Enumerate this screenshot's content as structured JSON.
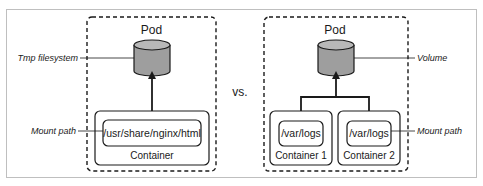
{
  "diagram": {
    "title": "",
    "separator_label": "vs.",
    "colors": {
      "frame": "#bfbfbf",
      "stroke": "#1a1a1a",
      "volume_fill": "#9e9e9e",
      "volume_top": "#b8b8b8",
      "container_fill": "#ffffff"
    },
    "left": {
      "pod_label": "Pod",
      "volume_callout": "Tmp filesystem",
      "mount_callout": "Mount path",
      "containers": [
        {
          "name": "Container",
          "mount_path": "/usr/share/nginx/html"
        }
      ]
    },
    "right": {
      "pod_label": "Pod",
      "volume_callout": "Volume",
      "mount_callout": "Mount path",
      "containers": [
        {
          "name": "Container 1",
          "mount_path": "/var/logs"
        },
        {
          "name": "Container 2",
          "mount_path": "/var/logs"
        }
      ]
    }
  }
}
